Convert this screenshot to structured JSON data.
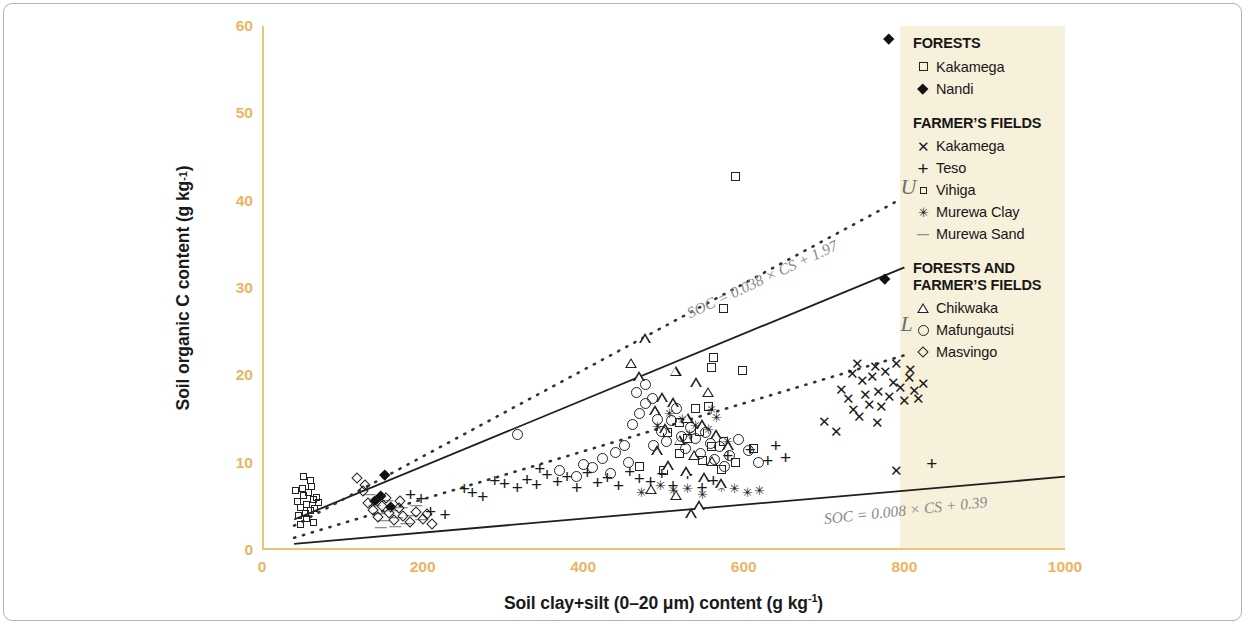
{
  "chart_data": {
    "type": "scatter",
    "title": "",
    "xlabel": "Soil clay+silt (0–20 μm) content (g kg-1)",
    "ylabel": "Soil organic C content (g kg-1)",
    "xlim": [
      0,
      1000
    ],
    "ylim": [
      0,
      60
    ],
    "xticks": [
      0,
      200,
      400,
      600,
      800,
      1000
    ],
    "yticks": [
      0,
      10,
      20,
      30,
      40,
      50,
      60
    ],
    "grid": false,
    "legend_position": "right",
    "axis_color": "#f0c278",
    "tick_label_color": "#e8b563",
    "legend_background": "#f7f0db",
    "marker_color": "#1a1a1a",
    "series": [
      {
        "name": "Kakamega",
        "group": "FORESTS",
        "marker": "open-square-small",
        "points": [
          [
            590,
            42.8
          ],
          [
            575,
            27.6
          ],
          [
            562,
            22.0
          ],
          [
            560,
            20.9
          ],
          [
            540,
            16.2
          ],
          [
            520,
            14.6
          ],
          [
            556,
            16.4
          ],
          [
            598,
            20.6
          ],
          [
            505,
            13.4
          ],
          [
            575,
            12.4
          ],
          [
            612,
            11.6
          ],
          [
            520,
            11.1
          ],
          [
            548,
            10.3
          ],
          [
            590,
            10.0
          ],
          [
            470,
            9.6
          ],
          [
            500,
            9.1
          ],
          [
            530,
            12.8
          ],
          [
            545,
            13.6
          ],
          [
            560,
            11.8
          ],
          [
            572,
            9.2
          ]
        ]
      },
      {
        "name": "Nandi",
        "group": "FORESTS",
        "marker": "filled-diamond",
        "points": [
          [
            780,
            58.5
          ],
          [
            775,
            31.1
          ],
          [
            153,
            8.6
          ],
          [
            148,
            6.2
          ],
          [
            141,
            5.6
          ],
          [
            160,
            4.9
          ]
        ]
      },
      {
        "name": "Kakamega",
        "group": "FARMER'S FIELDS",
        "marker": "x",
        "points": [
          [
            700,
            14.7
          ],
          [
            716,
            13.6
          ],
          [
            722,
            18.4
          ],
          [
            730,
            17.3
          ],
          [
            735,
            20.2
          ],
          [
            742,
            21.4
          ],
          [
            748,
            19.4
          ],
          [
            752,
            17.8
          ],
          [
            757,
            16.7
          ],
          [
            760,
            19.9
          ],
          [
            764,
            21.0
          ],
          [
            768,
            18.1
          ],
          [
            772,
            16.4
          ],
          [
            776,
            20.4
          ],
          [
            781,
            17.6
          ],
          [
            786,
            19.2
          ],
          [
            790,
            21.3
          ],
          [
            795,
            18.6
          ],
          [
            800,
            17.1
          ],
          [
            806,
            19.8
          ],
          [
            812,
            18.3
          ],
          [
            818,
            17.4
          ],
          [
            824,
            19.1
          ],
          [
            790,
            9.1
          ],
          [
            744,
            15.3
          ],
          [
            766,
            14.6
          ],
          [
            736,
            16.1
          ],
          [
            808,
            20.7
          ]
        ]
      },
      {
        "name": "Teso",
        "group": "FARMER'S FIELDS",
        "marker": "plus",
        "points": [
          [
            185,
            6.3
          ],
          [
            198,
            5.9
          ],
          [
            210,
            4.4
          ],
          [
            228,
            4.1
          ],
          [
            252,
            7.0
          ],
          [
            262,
            6.6
          ],
          [
            290,
            8.0
          ],
          [
            302,
            7.6
          ],
          [
            318,
            7.2
          ],
          [
            330,
            8.1
          ],
          [
            342,
            7.5
          ],
          [
            355,
            8.6
          ],
          [
            368,
            7.9
          ],
          [
            380,
            8.4
          ],
          [
            392,
            7.2
          ],
          [
            405,
            8.9
          ],
          [
            418,
            7.7
          ],
          [
            430,
            8.3
          ],
          [
            444,
            7.4
          ],
          [
            458,
            9.0
          ],
          [
            470,
            8.2
          ],
          [
            484,
            7.8
          ],
          [
            498,
            8.8
          ],
          [
            512,
            7.4
          ],
          [
            530,
            8.6
          ],
          [
            548,
            7.1
          ],
          [
            562,
            8.0
          ],
          [
            580,
            10.8
          ],
          [
            608,
            11.5
          ],
          [
            630,
            10.2
          ],
          [
            652,
            10.6
          ],
          [
            834,
            9.9
          ],
          [
            640,
            12.0
          ],
          [
            275,
            6.1
          ],
          [
            346,
            9.3
          ]
        ]
      },
      {
        "name": "Vihiga",
        "group": "FARMER'S FIELDS",
        "marker": "open-square-tiny",
        "points": [
          [
            44,
            5.6
          ],
          [
            48,
            4.9
          ],
          [
            52,
            6.2
          ],
          [
            56,
            5.2
          ],
          [
            60,
            4.5
          ],
          [
            50,
            7.0
          ],
          [
            58,
            6.6
          ],
          [
            64,
            5.8
          ],
          [
            46,
            3.9
          ],
          [
            54,
            4.2
          ],
          [
            62,
            7.3
          ],
          [
            68,
            6.0
          ],
          [
            42,
            6.8
          ],
          [
            66,
            4.7
          ],
          [
            56,
            3.6
          ],
          [
            70,
            5.4
          ],
          [
            60,
            8.0
          ],
          [
            52,
            8.4
          ],
          [
            48,
            2.9
          ],
          [
            64,
            3.2
          ]
        ]
      },
      {
        "name": "Murewa Clay",
        "group": "FARMER'S FIELDS",
        "marker": "asterisk",
        "points": [
          [
            472,
            6.6
          ],
          [
            496,
            7.4
          ],
          [
            512,
            6.8
          ],
          [
            530,
            7.0
          ],
          [
            548,
            6.4
          ],
          [
            560,
            16.1
          ],
          [
            572,
            7.2
          ],
          [
            588,
            7.0
          ],
          [
            604,
            6.6
          ],
          [
            620,
            6.8
          ],
          [
            540,
            14.2
          ],
          [
            524,
            15.0
          ],
          [
            556,
            13.8
          ],
          [
            508,
            15.6
          ],
          [
            492,
            14.1
          ],
          [
            566,
            15.2
          ],
          [
            532,
            13.2
          ],
          [
            580,
            12.4
          ]
        ]
      },
      {
        "name": "Murewa Sand",
        "group": "FARMER'S FIELDS",
        "marker": "dash",
        "points": [
          [
            134,
            6.4
          ],
          [
            140,
            5.1
          ],
          [
            146,
            4.2
          ],
          [
            152,
            3.4
          ],
          [
            156,
            5.7
          ],
          [
            162,
            4.6
          ],
          [
            168,
            3.8
          ],
          [
            174,
            4.9
          ],
          [
            180,
            3.1
          ],
          [
            186,
            4.0
          ],
          [
            192,
            5.2
          ],
          [
            198,
            3.5
          ],
          [
            148,
            2.6
          ],
          [
            166,
            2.8
          ]
        ]
      },
      {
        "name": "Chikwaka",
        "group": "FORESTS AND FARMER'S FIELDS",
        "marker": "triangle",
        "points": [
          [
            477,
            24.2
          ],
          [
            470,
            19.9
          ],
          [
            515,
            20.5
          ],
          [
            540,
            19.2
          ],
          [
            556,
            18.1
          ],
          [
            512,
            16.9
          ],
          [
            490,
            16.0
          ],
          [
            530,
            15.1
          ],
          [
            548,
            14.4
          ],
          [
            502,
            13.9
          ],
          [
            566,
            13.2
          ],
          [
            520,
            12.6
          ],
          [
            580,
            12.0
          ],
          [
            492,
            11.4
          ],
          [
            538,
            10.9
          ],
          [
            560,
            10.2
          ],
          [
            506,
            9.7
          ],
          [
            528,
            9.0
          ],
          [
            550,
            8.3
          ],
          [
            572,
            7.6
          ],
          [
            484,
            7.0
          ],
          [
            516,
            6.3
          ],
          [
            544,
            5.1
          ],
          [
            534,
            4.2
          ],
          [
            460,
            21.4
          ],
          [
            498,
            17.5
          ]
        ]
      },
      {
        "name": "Mafungautsi",
        "group": "FORESTS AND FARMER'S FIELDS",
        "marker": "circle",
        "points": [
          [
            318,
            13.2
          ],
          [
            370,
            9.1
          ],
          [
            400,
            9.8
          ],
          [
            424,
            10.5
          ],
          [
            440,
            11.2
          ],
          [
            452,
            12.0
          ],
          [
            462,
            14.4
          ],
          [
            470,
            15.6
          ],
          [
            478,
            16.8
          ],
          [
            486,
            17.4
          ],
          [
            492,
            15.0
          ],
          [
            498,
            13.6
          ],
          [
            504,
            12.4
          ],
          [
            510,
            14.8
          ],
          [
            516,
            16.2
          ],
          [
            522,
            13.0
          ],
          [
            528,
            11.6
          ],
          [
            534,
            14.0
          ],
          [
            540,
            12.8
          ],
          [
            546,
            11.0
          ],
          [
            552,
            13.4
          ],
          [
            558,
            12.2
          ],
          [
            564,
            10.4
          ],
          [
            570,
            11.8
          ],
          [
            576,
            9.6
          ],
          [
            582,
            10.8
          ],
          [
            594,
            12.6
          ],
          [
            606,
            11.4
          ],
          [
            618,
            10.0
          ],
          [
            392,
            8.4
          ],
          [
            412,
            9.4
          ],
          [
            434,
            8.8
          ],
          [
            456,
            10.0
          ],
          [
            466,
            18.0
          ],
          [
            478,
            19.0
          ],
          [
            488,
            12.0
          ]
        ]
      },
      {
        "name": "Masvingo",
        "group": "FORESTS AND FARMER'S FIELDS",
        "marker": "open-diamond",
        "points": [
          [
            118,
            8.3
          ],
          [
            126,
            6.7
          ],
          [
            132,
            5.4
          ],
          [
            138,
            4.6
          ],
          [
            144,
            3.8
          ],
          [
            150,
            5.0
          ],
          [
            158,
            4.2
          ],
          [
            164,
            3.4
          ],
          [
            170,
            4.8
          ],
          [
            176,
            3.9
          ],
          [
            184,
            3.2
          ],
          [
            192,
            4.4
          ],
          [
            128,
            7.5
          ],
          [
            154,
            6.0
          ],
          [
            172,
            5.6
          ],
          [
            200,
            3.6
          ],
          [
            206,
            4.1
          ],
          [
            212,
            3.0
          ]
        ]
      }
    ],
    "boundary_lines": [
      {
        "name": "upper-solid",
        "label": "U_solid",
        "style": "solid",
        "equation": "SOC = 0.038 × CS + 1.97",
        "slope": 0.038,
        "intercept": 1.97,
        "x_from": 40,
        "x_to": 800
      },
      {
        "name": "upper-dotted",
        "label": "U",
        "style": "dotted",
        "slope": 0.0495,
        "intercept": 0.8,
        "x_from": 40,
        "x_to": 790
      },
      {
        "name": "lower-dotted",
        "label": "L",
        "style": "dotted",
        "slope": 0.0275,
        "intercept": 0.3,
        "x_from": 40,
        "x_to": 800
      },
      {
        "name": "lower-solid",
        "label": "L_solid",
        "style": "solid",
        "equation": "SOC = 0.008 × CS + 0.39",
        "slope": 0.008,
        "intercept": 0.39,
        "x_from": 40,
        "x_to": 1000
      }
    ],
    "annotations": [
      {
        "name": "upper-boundary-letter",
        "text": "U",
        "x": 795,
        "y": 41.5
      },
      {
        "name": "lower-boundary-letter",
        "text": "L",
        "x": 795,
        "y": 25.8
      },
      {
        "name": "upper-equation",
        "text": "SOC = 0.038 × CS + 1.97",
        "x": 530,
        "y": 27.0,
        "angle": -25
      },
      {
        "name": "lower-equation",
        "text": "SOC = 0.008 × CS + 0.39",
        "x": 700,
        "y": 3.6,
        "angle": -6
      }
    ]
  },
  "axis": {
    "x_title_parts": {
      "main": "Soil clay+silt (0–20 μm) content (g kg",
      "sup": "-1",
      "tail": ")"
    },
    "y_title_parts": {
      "main": "Soil organic C content (g kg",
      "sup": "-1",
      "tail": ")"
    }
  },
  "legend": {
    "groups": [
      {
        "heading": "FORESTS",
        "items": [
          {
            "label": "Kakamega",
            "marker": "open-square-small"
          },
          {
            "label": "Nandi",
            "marker": "filled-diamond"
          }
        ]
      },
      {
        "heading": "FARMER’S FIELDS",
        "items": [
          {
            "label": "Kakamega",
            "marker": "x"
          },
          {
            "label": "Teso",
            "marker": "plus"
          },
          {
            "label": "Vihiga",
            "marker": "open-square-tiny"
          },
          {
            "label": "Murewa Clay",
            "marker": "asterisk"
          },
          {
            "label": "Murewa Sand",
            "marker": "dash"
          }
        ]
      },
      {
        "heading_line1": "FORESTS AND",
        "heading_line2": "FARMER’S FIELDS",
        "items": [
          {
            "label": "Chikwaka",
            "marker": "triangle"
          },
          {
            "label": "Mafungautsi",
            "marker": "circle"
          },
          {
            "label": "Masvingo",
            "marker": "open-diamond"
          }
        ]
      }
    ]
  }
}
